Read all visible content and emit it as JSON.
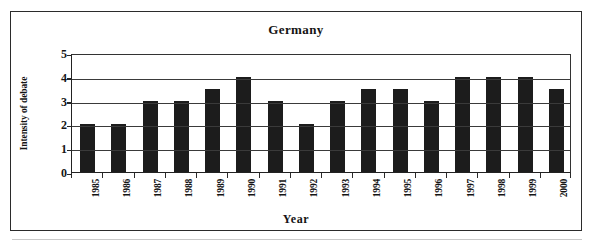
{
  "figure": {
    "title": "Germany"
  },
  "chart_data": {
    "type": "bar",
    "title": "Germany",
    "xlabel": "Year",
    "ylabel": "Intensity of debate",
    "categories": [
      "1985",
      "1986",
      "1987",
      "1988",
      "1989",
      "1990",
      "1991",
      "1992",
      "1993",
      "1994",
      "1995",
      "1996",
      "1997",
      "1998",
      "1999",
      "2000"
    ],
    "values": [
      2,
      2,
      3,
      3,
      3.5,
      4,
      3,
      2,
      3,
      3.5,
      3.5,
      3,
      4,
      4,
      4,
      3.5
    ],
    "ylim": [
      0,
      5
    ],
    "yticks": [
      "0",
      "1",
      "2",
      "3",
      "4",
      "5"
    ],
    "grid": true,
    "legend": false,
    "bar_color": "#1c1c1c"
  }
}
